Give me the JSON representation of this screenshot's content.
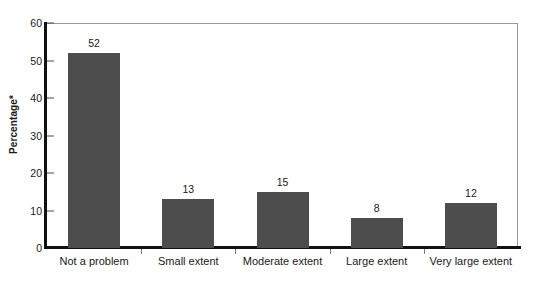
{
  "chart_data": {
    "type": "bar",
    "title": "",
    "subtitle": "",
    "xlabel": "",
    "ylabel": "Percentage*",
    "categories": [
      "Not a problem",
      "Small extent",
      "Moderate extent",
      "Large extent",
      "Very large extent"
    ],
    "values": [
      52,
      13,
      15,
      8,
      12
    ],
    "value_labels": [
      "52",
      "13",
      "15",
      "8",
      "12"
    ],
    "ylim": [
      0,
      60
    ],
    "yticks": [
      0,
      10,
      20,
      30,
      40,
      50,
      60
    ],
    "ytick_labels": [
      "0",
      "10",
      "20",
      "30",
      "40",
      "50",
      "60"
    ],
    "grid": false,
    "legend": null,
    "legend_position": "none",
    "bar_color": "#4d4d4d",
    "axis_color": "#111111",
    "frame_color": "#9a9a9a",
    "background": "#ffffff",
    "annotations": []
  }
}
